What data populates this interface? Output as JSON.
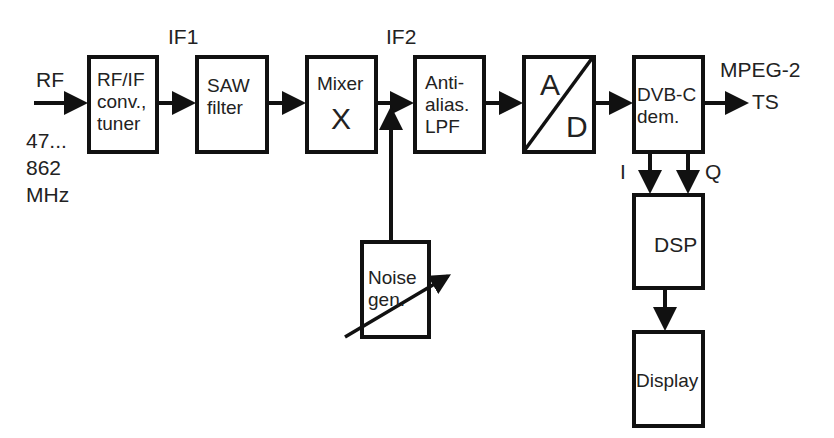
{
  "diagram": {
    "input": {
      "label": "RF",
      "range_line1": "47...",
      "range_line2": "862",
      "range_line3": "MHz"
    },
    "intermediate_labels": {
      "if1": "IF1",
      "if2": "IF2"
    },
    "blocks": {
      "tuner": {
        "line1": "RF/IF",
        "line2": "conv.,",
        "line3": "tuner"
      },
      "saw": {
        "line1": "SAW",
        "line2": "filter"
      },
      "mixer": {
        "line1": "Mixer",
        "symbol": "X"
      },
      "lpf": {
        "line1": "Anti-",
        "line2": "alias.",
        "line3": "LPF"
      },
      "adc": {
        "top": "A",
        "bottom": "D"
      },
      "demod": {
        "line1": "DVB-C",
        "line2": "dem."
      },
      "noise": {
        "line1": "Noise",
        "line2": "gen."
      },
      "dsp": {
        "line1": "DSP"
      },
      "display": {
        "line1": "Display"
      }
    },
    "output": {
      "line1": "MPEG-2",
      "line2": "TS"
    },
    "iq": {
      "i": "I",
      "q": "Q"
    }
  }
}
